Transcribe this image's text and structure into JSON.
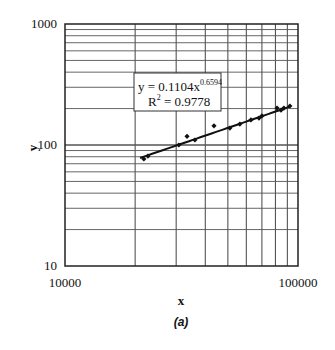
{
  "chart_data": {
    "type": "scatter",
    "title": "",
    "caption": "(a)",
    "xlabel": "x",
    "ylabel": "y",
    "xscale": "log",
    "yscale": "log",
    "xlim": [
      10000,
      100000
    ],
    "ylim": [
      10,
      1000
    ],
    "grid": true,
    "x_tick_labels": [
      "10000",
      "100000"
    ],
    "x_ticks": [
      10000,
      100000
    ],
    "y_tick_labels": [
      "10",
      "100",
      "1000"
    ],
    "y_ticks": [
      10,
      100,
      1000
    ],
    "series": [
      {
        "name": "data",
        "marker": "diamond",
        "color": "#111111",
        "x": [
          21800,
          22700,
          30800,
          33400,
          36100,
          43600,
          51000,
          56300,
          62800,
          68000,
          70000,
          81300,
          84500,
          87000,
          92300
        ],
        "y": [
          76.6,
          81,
          100,
          118,
          110,
          144,
          138,
          149,
          161,
          167,
          174,
          202,
          194,
          202,
          210
        ]
      }
    ],
    "trendline": {
      "type": "power",
      "coefficient": 0.1104,
      "exponent": 0.6594,
      "r_squared": 0.9778,
      "x_range": [
        21000,
        93000
      ],
      "equation_text": "y = 0.1104x",
      "exponent_text": "0.6594",
      "r2_prefix": "R",
      "r2_sup": "2",
      "r2_text": " = 0.9778"
    }
  }
}
